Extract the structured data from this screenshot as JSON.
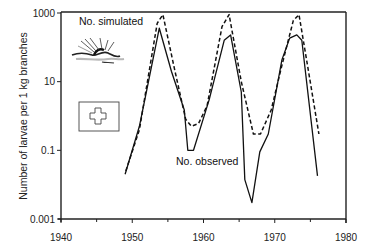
{
  "chart_data": {
    "type": "line",
    "title": "",
    "xlabel": "",
    "ylabel": "Number of larvae per 1 kg  branches",
    "xlim": [
      1940,
      1980
    ],
    "ylim": [
      0.001,
      1000
    ],
    "yscale": "log",
    "xticks": [
      1940,
      1950,
      1960,
      1970,
      1980
    ],
    "xtick_labels": [
      "1940",
      "1950",
      "1960",
      "1970",
      "1980"
    ],
    "xminor_ticks": [
      1945,
      1955,
      1965,
      1975
    ],
    "yticks": [
      0.001,
      0.1,
      10,
      1000
    ],
    "ytick_labels": [
      "0.001",
      "0.1",
      "10",
      "1000"
    ],
    "grid": false,
    "legend": "none",
    "series": [
      {
        "name": "No. observed",
        "style": "solid",
        "x": [
          1949.0,
          1951.0,
          1953.8,
          1955.5,
          1957.3,
          1957.8,
          1958.6,
          1960.8,
          1962.9,
          1963.8,
          1965.3,
          1965.8,
          1966.8,
          1967.9,
          1969.1,
          1971.0,
          1972.1,
          1973.1,
          1973.8,
          1976.0
        ],
        "y": [
          0.02,
          0.5,
          360,
          20,
          1.5,
          0.1,
          0.1,
          3,
          160,
          230,
          5,
          0.014,
          0.003,
          0.09,
          0.3,
          43,
          186,
          230,
          160,
          0.018
        ]
      },
      {
        "name": "No. simulated",
        "style": "dashed",
        "x": [
          1949.1,
          1951.0,
          1953.5,
          1954.3,
          1956.0,
          1957.5,
          1958.3,
          1959.3,
          1960.5,
          1962.6,
          1963.6,
          1965.3,
          1967.0,
          1968.0,
          1969.5,
          1971.0,
          1972.6,
          1973.4,
          1974.6,
          1976.2
        ],
        "y": [
          0.025,
          0.4,
          500,
          900,
          20,
          0.8,
          0.5,
          0.6,
          2,
          400,
          900,
          10,
          0.3,
          0.3,
          1.5,
          30,
          600,
          900,
          30,
          0.3
        ]
      }
    ],
    "annotations": [
      {
        "text": "No. simulated",
        "near": "top-left, first peak"
      },
      {
        "text": "No. observed",
        "near": "center, below 1958 trough"
      }
    ]
  },
  "figure": {
    "insets": [
      {
        "name": "larva-on-branch-illustration"
      },
      {
        "name": "swiss-flag-icon"
      }
    ]
  }
}
